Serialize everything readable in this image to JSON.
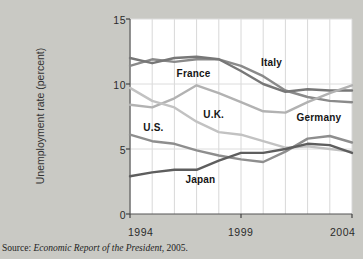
{
  "figure": {
    "top_cropped_text": "",
    "source_prefix": "Source:",
    "source_italic": "Economic Report of the President,",
    "source_suffix": "2005."
  },
  "chart_data": {
    "type": "line",
    "title": "",
    "xlabel": "",
    "ylabel": "Unemployment rate (percent)",
    "xlim": [
      1994,
      2004
    ],
    "ylim": [
      0,
      15
    ],
    "yticks": [
      0,
      5,
      10,
      15
    ],
    "ytick_labels": [
      "0",
      "5",
      "10",
      "15"
    ],
    "xticks": [
      1994,
      1999,
      2004
    ],
    "xtick_labels": [
      "1994",
      "1999",
      "2004"
    ],
    "grid": "vertical-and-horizontal",
    "legend": "inline-labels",
    "x": [
      1994,
      1995,
      1996,
      1997,
      1998,
      1999,
      2000,
      2001,
      2002,
      2003,
      2004
    ],
    "series": [
      {
        "name": "Italy",
        "color": "#8a8a8a",
        "label_x": 1999.9,
        "label_y": 11.6,
        "values": [
          11.4,
          11.9,
          11.7,
          11.9,
          11.9,
          11.4,
          10.6,
          9.5,
          9.0,
          8.7,
          8.6
        ]
      },
      {
        "name": "France",
        "color": "#777777",
        "label_x": 1996.1,
        "label_y": 10.8,
        "values": [
          12.0,
          11.6,
          12.0,
          12.1,
          11.9,
          11.0,
          10.0,
          9.4,
          9.6,
          9.5,
          9.5
        ]
      },
      {
        "name": "Germany",
        "color": "#b2b2b2",
        "label_x": 2001.5,
        "label_y": 7.4,
        "values": [
          8.4,
          8.2,
          8.9,
          9.9,
          9.3,
          8.6,
          7.9,
          7.8,
          8.6,
          9.3,
          9.9
        ]
      },
      {
        "name": "U.K.",
        "color": "#c2c2c2",
        "label_x": 1997.3,
        "label_y": 7.6,
        "values": [
          9.7,
          8.7,
          8.2,
          7.1,
          6.3,
          6.1,
          5.6,
          5.1,
          5.2,
          5.0,
          4.8
        ]
      },
      {
        "name": "U.S.",
        "color": "#8e8e8e",
        "label_x": 1994.6,
        "label_y": 6.6,
        "values": [
          6.1,
          5.6,
          5.4,
          4.9,
          4.5,
          4.2,
          4.0,
          4.8,
          5.8,
          6.0,
          5.5
        ]
      },
      {
        "name": "Japan",
        "color": "#5e5e5e",
        "label_x": 1996.5,
        "label_y": 2.6,
        "values": [
          2.9,
          3.2,
          3.4,
          3.4,
          4.1,
          4.7,
          4.7,
          5.0,
          5.4,
          5.3,
          4.7
        ]
      }
    ]
  }
}
